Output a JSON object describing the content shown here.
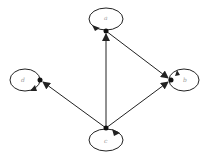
{
  "diagram": {
    "type": "directed-graph",
    "nodes": [
      {
        "id": "a",
        "label": "a",
        "x": 106,
        "y": 31,
        "loop": {
          "cx": 106,
          "cy": 19,
          "rx": 17,
          "ry": 11
        }
      },
      {
        "id": "d",
        "label": "d",
        "x": 40,
        "y": 80,
        "loop": {
          "cx": 25,
          "cy": 80,
          "rx": 15,
          "ry": 11
        }
      },
      {
        "id": "b",
        "label": "b",
        "x": 171,
        "y": 80,
        "loop": {
          "cx": 184,
          "cy": 80,
          "rx": 15,
          "ry": 11
        }
      },
      {
        "id": "c",
        "label": "c",
        "x": 106,
        "y": 128,
        "loop": {
          "cx": 106,
          "cy": 140,
          "rx": 17,
          "ry": 11
        }
      }
    ],
    "edges": [
      {
        "from": "c",
        "to": "a"
      },
      {
        "from": "c",
        "to": "d"
      },
      {
        "from": "c",
        "to": "b"
      },
      {
        "from": "a",
        "to": "b"
      },
      {
        "from": "a",
        "to": "a"
      },
      {
        "from": "d",
        "to": "d"
      },
      {
        "from": "b",
        "to": "b"
      },
      {
        "from": "c",
        "to": "c"
      }
    ],
    "colors": {
      "stroke": "#222222",
      "label": "#9a9a9a",
      "background": "#ffffff"
    }
  }
}
